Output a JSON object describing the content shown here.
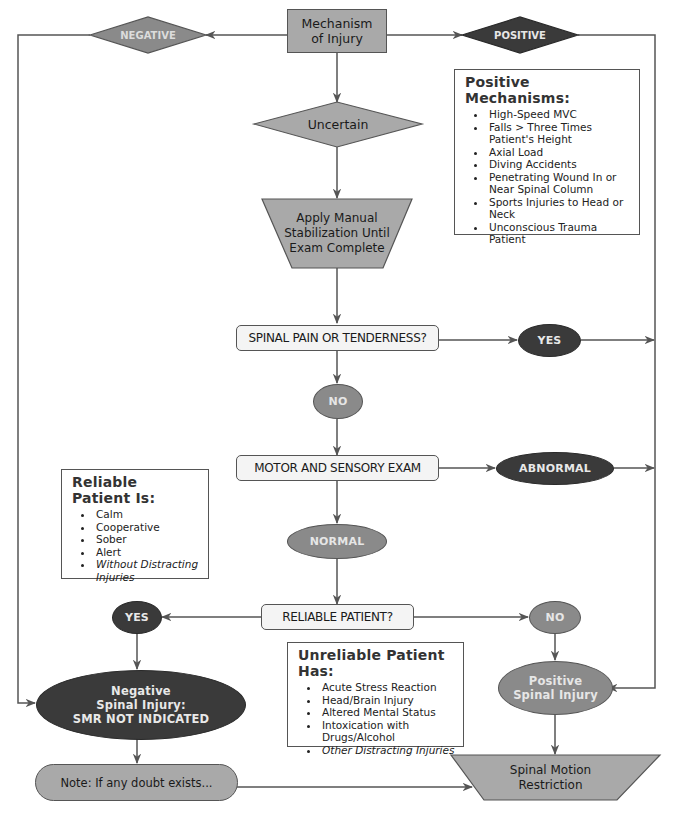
{
  "nodes": {
    "mechanism": "Mechanism of Injury",
    "negative": "NEGATIVE",
    "positive": "POSITIVE",
    "uncertain": "Uncertain",
    "stabilization": "Apply Manual Stabilization Until Exam Complete",
    "spinal_pain": "SPINAL PAIN OR TENDERNESS?",
    "yes_pain": "YES",
    "no_pain": "NO",
    "motor_exam": "MOTOR AND SENSORY EXAM",
    "abnormal": "ABNORMAL",
    "normal": "NORMAL",
    "reliable_q": "RELIABLE PATIENT?",
    "yes_reliable": "YES",
    "no_reliable": "NO",
    "negative_injury": {
      "line1": "Negative",
      "line2": "Spinal Injury:",
      "line3": "SMR NOT INDICATED"
    },
    "positive_injury": {
      "line1": "Positive",
      "line2": "Spinal Injury"
    },
    "note": "Note: If any doubt exists...",
    "smr": {
      "line1": "Spinal Motion",
      "line2": "Restriction"
    }
  },
  "positive_mechanisms": {
    "title": "Positive Mechanisms:",
    "items": [
      "High-Speed MVC",
      "Falls > Three Times Patient's Height",
      "Axial Load",
      "Diving Accidents",
      "Penetrating Wound In or Near Spinal Column",
      "Sports Injuries to Head or Neck",
      "Unconscious Trauma Patient"
    ]
  },
  "reliable_patient": {
    "title": "Reliable Patient Is:",
    "items": [
      "Calm",
      "Cooperative",
      "Sober",
      "Alert",
      "Without Distracting Injuries"
    ]
  },
  "unreliable_patient": {
    "title": "Unreliable Patient Has:",
    "items": [
      "Acute Stress Reaction",
      "Head/Brain Injury",
      "Altered Mental Status",
      "Intoxication with Drugs/Alcohol",
      "Other Distracting Injuries"
    ]
  },
  "colors": {
    "dark_fill": "#3a3a3a",
    "mid_fill": "#8a8a8a",
    "light_fill": "#a9a9a9",
    "line": "#555555"
  }
}
